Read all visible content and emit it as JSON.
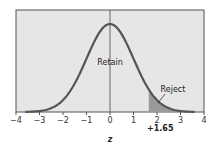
{
  "chart_data": {
    "type": "area",
    "title": "",
    "xlabel": "z",
    "ylabel": "",
    "xlim": [
      -4,
      4
    ],
    "x_ticks": [
      -4,
      -3,
      -2,
      -1,
      0,
      1,
      2,
      3,
      4
    ],
    "x_tick_labels": [
      "−4",
      "−3",
      "−2",
      "−1",
      "0",
      "1",
      "2",
      "3",
      "4"
    ],
    "curve": "standard normal distribution",
    "curve_range": [
      -3.6,
      3.6
    ],
    "critical_value": 1.65,
    "critical_label": "+1.65",
    "regions": [
      {
        "name": "Retain",
        "from": -3.6,
        "to": 1.65
      },
      {
        "name": "Reject",
        "from": 1.65,
        "to": 3.6,
        "shaded": true
      }
    ],
    "annotations": [
      "Retain",
      "Reject"
    ],
    "grid": false,
    "legend": "none",
    "colors": {
      "plot_bg": "#e6e6e6",
      "curve": "#555555",
      "reject_fill": "#9a9a9a",
      "frame": "#555555"
    }
  }
}
